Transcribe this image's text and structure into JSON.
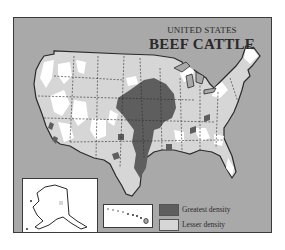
{
  "title": {
    "top": "UNITED STATES",
    "main": "BEEF CATTLE"
  },
  "legend": {
    "items": [
      {
        "label": "Greatest density",
        "color": "#5e5e5e"
      },
      {
        "label": "Lesser density",
        "color": "#d6d6d6"
      }
    ],
    "note": "(Calves and bulls excluded)"
  },
  "colors": {
    "background": "#a9a9a9",
    "land_none": "#ffffff",
    "lesser_density": "#d6d6d6",
    "greatest_density": "#5e5e5e",
    "borders": "#2a2a2a"
  },
  "insets": [
    {
      "name": "Alaska"
    },
    {
      "name": "Hawaii"
    }
  ]
}
